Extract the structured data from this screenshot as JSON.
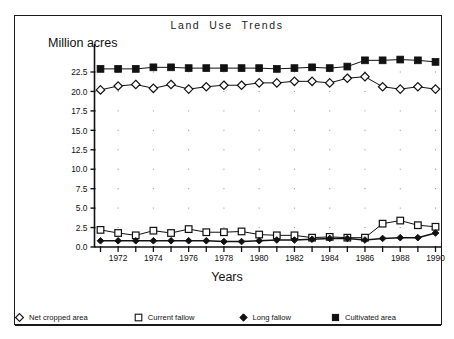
{
  "figure": {
    "title": "Land  Use  Trends",
    "y_axis_title": "Million acres",
    "x_axis_title": "Years",
    "background_color": "#ffffff",
    "frame_color": "#1a1a1a"
  },
  "legend": {
    "entries": [
      {
        "label": "Net cropped area",
        "marker": "open-diamond-icon"
      },
      {
        "label": "Current fallow",
        "marker": "open-square-icon"
      },
      {
        "label": "Long fallow",
        "marker": "filled-diamond-icon"
      },
      {
        "label": "Cultivated area",
        "marker": "filled-square-icon"
      }
    ]
  },
  "chart_data": {
    "type": "line",
    "title": "Land  Use  Trends",
    "xlabel": "Years",
    "ylabel": "Million acres",
    "xlim": [
      1970.5,
      1990.5
    ],
    "ylim": [
      0.0,
      25.5
    ],
    "grid": "dots-at-major-intersections",
    "legend_position": "below-plot",
    "x": [
      1971,
      1972,
      1973,
      1974,
      1975,
      1976,
      1977,
      1978,
      1979,
      1980,
      1981,
      1982,
      1983,
      1984,
      1985,
      1986,
      1987,
      1988,
      1989,
      1990
    ],
    "xtick_labels": [
      "1972",
      "1974",
      "1976",
      "1978",
      "1980",
      "1982",
      "1984",
      "1986",
      "1988",
      "1990"
    ],
    "xtick_values": [
      1972,
      1974,
      1976,
      1978,
      1980,
      1982,
      1984,
      1986,
      1988,
      1990
    ],
    "ytick_labels": [
      "0.0",
      "2.5",
      "5.0",
      "7.5",
      "10.0",
      "12.5",
      "15.0",
      "17.5",
      "20.0",
      "22.5"
    ],
    "ytick_values": [
      0.0,
      2.5,
      5.0,
      7.5,
      10.0,
      12.5,
      15.0,
      17.5,
      20.0,
      22.5
    ],
    "series": [
      {
        "name": "Cultivated area",
        "marker": "filled-square",
        "values": [
          22.9,
          22.9,
          22.9,
          23.1,
          23.1,
          23.0,
          23.0,
          23.0,
          23.0,
          23.0,
          22.9,
          23.0,
          23.1,
          23.0,
          23.2,
          24.0,
          24.0,
          24.1,
          24.0,
          23.8
        ]
      },
      {
        "name": "Net cropped area",
        "marker": "open-diamond",
        "values": [
          20.2,
          20.7,
          20.9,
          20.4,
          20.9,
          20.3,
          20.6,
          20.8,
          20.8,
          21.1,
          21.1,
          21.3,
          21.3,
          21.1,
          21.7,
          21.9,
          20.6,
          20.3,
          20.6,
          20.3
        ]
      },
      {
        "name": "Current fallow",
        "marker": "open-square",
        "values": [
          2.2,
          1.8,
          1.5,
          2.1,
          1.8,
          2.3,
          1.9,
          1.9,
          2.0,
          1.6,
          1.5,
          1.5,
          1.2,
          1.3,
          1.2,
          1.2,
          3.0,
          3.4,
          2.8,
          2.6
        ]
      },
      {
        "name": "Long fallow",
        "marker": "filled-diamond",
        "values": [
          0.8,
          0.8,
          0.8,
          0.8,
          0.8,
          0.8,
          0.8,
          0.7,
          0.7,
          0.8,
          0.9,
          0.9,
          1.0,
          1.1,
          1.1,
          0.9,
          1.1,
          1.2,
          1.2,
          1.8
        ]
      }
    ]
  }
}
